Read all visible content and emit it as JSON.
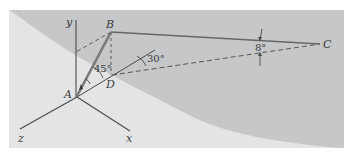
{
  "figure": {
    "colors": {
      "background": "#ffffff",
      "region_dark": "#c5c7c9",
      "region_light": "#e3e4e5",
      "line": "#4a4a4a",
      "rod": "#777777"
    },
    "points": {
      "A": "A",
      "B": "B",
      "C": "C",
      "D": "D"
    },
    "axes": {
      "x": "x",
      "y": "y",
      "z": "z"
    },
    "angles": {
      "angle_BDA": "45°",
      "angle_horizontal": "30°",
      "angle_BC_DC": "8°"
    }
  }
}
